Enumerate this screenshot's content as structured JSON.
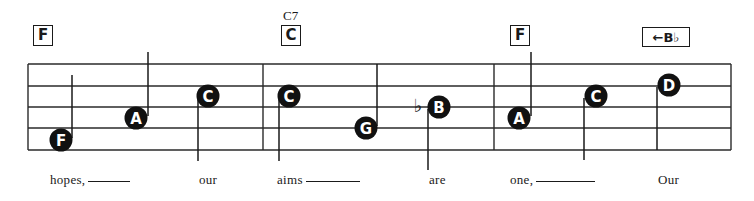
{
  "chords": [
    {
      "label": "F",
      "x": 33,
      "y": 25,
      "w": 20,
      "h": 21
    },
    {
      "label": "C",
      "name": "C7",
      "x": 281,
      "y": 25,
      "w": 20,
      "h": 21
    },
    {
      "label": "F",
      "x": 510,
      "y": 25,
      "w": 20,
      "h": 21
    },
    {
      "label": "Bb",
      "display": "←B♭",
      "x": 642,
      "y": 27,
      "w": 48,
      "h": 20
    }
  ],
  "chord_names": [
    {
      "text": "C7",
      "x": 283,
      "y": 8
    }
  ],
  "staff": {
    "left": 28,
    "right": 731,
    "lines_y": [
      64,
      86,
      107,
      128,
      150
    ],
    "barlines_x": [
      28,
      263,
      494,
      731
    ],
    "color": "#2a2a2a"
  },
  "notes": [
    {
      "letter": "F",
      "cx": 61,
      "cy": 140,
      "stem": "up",
      "stem_x": 72,
      "stem_end": 75
    },
    {
      "letter": "A",
      "cx": 136,
      "cy": 118,
      "stem": "up",
      "stem_x": 148,
      "stem_end": 52
    },
    {
      "letter": "C",
      "cx": 208,
      "cy": 96,
      "stem": "down",
      "stem_x": 198,
      "stem_end": 161
    },
    {
      "letter": "C",
      "cx": 289,
      "cy": 96,
      "stem": "down",
      "stem_x": 279,
      "stem_end": 161
    },
    {
      "letter": "G",
      "cx": 366,
      "cy": 128,
      "stem": "up",
      "stem_x": 377,
      "stem_end": 64
    },
    {
      "letter": "B",
      "cx": 439,
      "cy": 107,
      "stem": "down",
      "stem_x": 428,
      "stem_end": 170,
      "accidental": "♭"
    },
    {
      "letter": "A",
      "cx": 519,
      "cy": 118,
      "stem": "up",
      "stem_x": 531,
      "stem_end": 52
    },
    {
      "letter": "C",
      "cx": 596,
      "cy": 96,
      "stem": "down",
      "stem_x": 584,
      "stem_end": 160
    },
    {
      "letter": "D",
      "cx": 669,
      "cy": 85,
      "stem": "down",
      "stem_x": 657,
      "stem_end": 150
    }
  ],
  "lyrics": [
    {
      "text": "hopes,",
      "x": 50,
      "extender": 42
    },
    {
      "text": "our",
      "x": 199
    },
    {
      "text": "aims",
      "x": 277,
      "extender": 54
    },
    {
      "text": "are",
      "x": 429
    },
    {
      "text": "one,",
      "x": 510,
      "extender": 59
    },
    {
      "text": "Our",
      "x": 658
    }
  ],
  "colors": {
    "ink": "#1a1a1a",
    "note_fill": "#111111",
    "note_text": "#ffffff"
  }
}
